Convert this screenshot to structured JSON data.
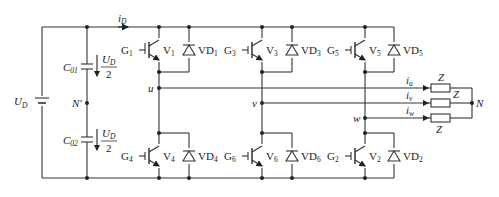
{
  "diagram": {
    "type": "three-phase voltage source inverter circuit",
    "source": {
      "label": "U",
      "label_sub": "D"
    },
    "dc_current": {
      "label": "i",
      "label_sub": "D"
    },
    "capacitors": [
      {
        "label": "C",
        "label_sub": "01",
        "voltage_num": "U",
        "voltage_num_sub": "D",
        "voltage_den": "2"
      },
      {
        "label": "C",
        "label_sub": "02",
        "voltage_num": "U",
        "voltage_num_sub": "D",
        "voltage_den": "2"
      }
    ],
    "midpoint": "N'",
    "switches": [
      {
        "gate": "G",
        "gate_sub": "1",
        "igbt": "V",
        "igbt_sub": "1",
        "diode": "VD",
        "diode_sub": "1"
      },
      {
        "gate": "G",
        "gate_sub": "3",
        "igbt": "V",
        "igbt_sub": "3",
        "diode": "VD",
        "diode_sub": "3"
      },
      {
        "gate": "G",
        "gate_sub": "5",
        "igbt": "V",
        "igbt_sub": "5",
        "diode": "VD",
        "diode_sub": "5"
      },
      {
        "gate": "G",
        "gate_sub": "4",
        "igbt": "V",
        "igbt_sub": "4",
        "diode": "VD",
        "diode_sub": "4"
      },
      {
        "gate": "G",
        "gate_sub": "6",
        "igbt": "V",
        "igbt_sub": "6",
        "diode": "VD",
        "diode_sub": "6"
      },
      {
        "gate": "G",
        "gate_sub": "2",
        "igbt": "V",
        "igbt_sub": "2",
        "diode": "VD",
        "diode_sub": "2"
      }
    ],
    "phase_nodes": [
      "u",
      "v",
      "w"
    ],
    "phase_currents": [
      {
        "label": "i",
        "label_sub": "u"
      },
      {
        "label": "i",
        "label_sub": "v"
      },
      {
        "label": "i",
        "label_sub": "w"
      }
    ],
    "loads": [
      "Z",
      "Z",
      "Z"
    ],
    "neutral": "N"
  }
}
